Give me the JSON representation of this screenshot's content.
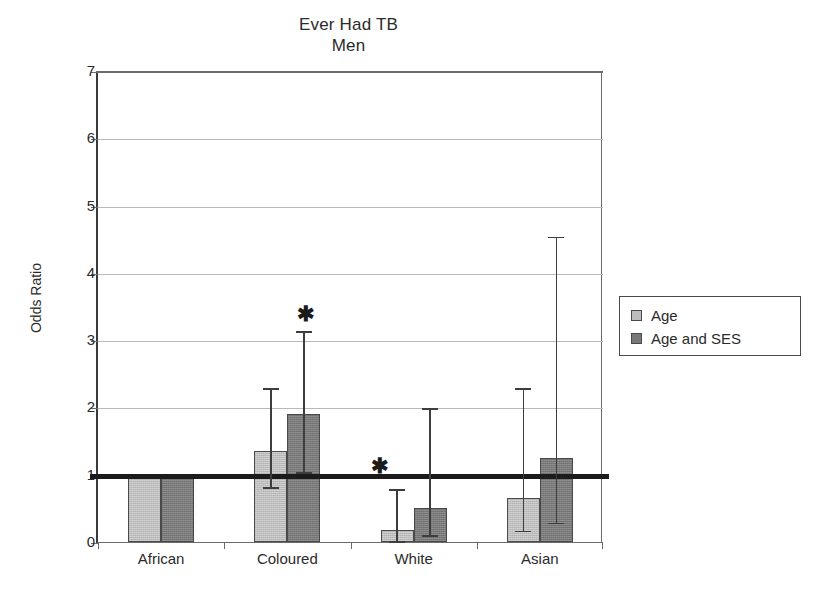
{
  "chart_data": {
    "type": "bar",
    "title": "Ever Had TB",
    "subtitle": "Men",
    "xlabel": "",
    "ylabel": "Odds Ratio",
    "ylim": [
      0,
      7
    ],
    "yticks": [
      0,
      1,
      2,
      3,
      4,
      5,
      6,
      7
    ],
    "grid": true,
    "reference_line": 1,
    "legend_position": "right",
    "categories": [
      "African",
      "Coloured",
      "White",
      "Asian"
    ],
    "series": [
      {
        "name": "Age",
        "color": "#bdbdbd",
        "values": [
          1.0,
          1.35,
          0.18,
          0.65
        ],
        "ci_low": [
          null,
          0.83,
          0.03,
          0.18
        ],
        "ci_high": [
          null,
          2.3,
          0.8,
          2.3
        ],
        "significant": [
          false,
          false,
          true,
          false
        ]
      },
      {
        "name": "Age and SES",
        "color": "#787878",
        "values": [
          1.0,
          1.9,
          0.5,
          1.25
        ],
        "ci_low": [
          null,
          1.05,
          0.12,
          0.3
        ],
        "ci_high": [
          null,
          3.15,
          2.0,
          4.55
        ],
        "significant": [
          false,
          true,
          false,
          false
        ]
      }
    ],
    "annotations": [
      {
        "symbol": "✱",
        "category": "Coloured",
        "series": "Age and SES",
        "y": 3.4
      },
      {
        "symbol": "✱",
        "category": "White",
        "series": "Age",
        "y": 1.15
      }
    ]
  },
  "legend": {
    "items": [
      {
        "label": "Age",
        "swatch": "light"
      },
      {
        "label": "Age and SES",
        "swatch": "dark"
      }
    ]
  },
  "axis": {
    "y_tick_labels": [
      "0",
      "1",
      "2",
      "3",
      "4",
      "5",
      "6",
      "7"
    ],
    "x_tick_labels": [
      "African",
      "Coloured",
      "White",
      "Asian"
    ]
  }
}
